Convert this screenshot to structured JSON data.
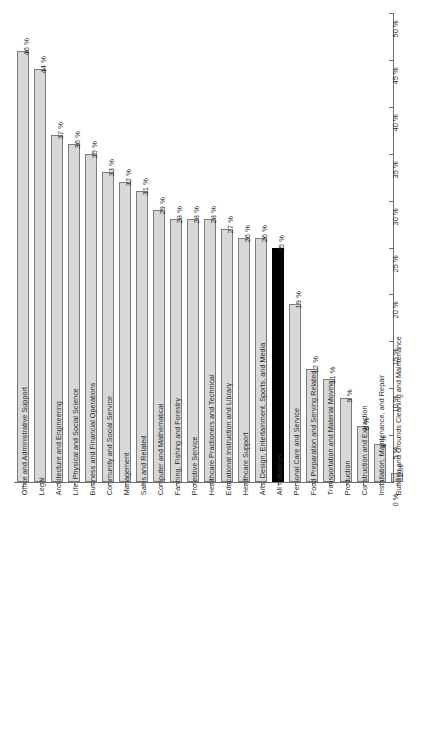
{
  "chart_data": {
    "type": "bar",
    "title": "",
    "subtitle": "",
    "xlabel": "",
    "ylabel": "",
    "ylim": [
      0,
      50
    ],
    "grid": false,
    "legend": "none",
    "orientation": "vertical",
    "axis_position": "right",
    "value_suffix": "%",
    "highlight_category": "All Industries",
    "colors": {
      "bar_fill": "#d8d8d8",
      "bar_border": "#7c7c7c",
      "highlight_fill": "#000000",
      "axis": "#6e6e6e",
      "text": "#2b2b2b",
      "background": "#ffffff"
    },
    "tick_labels": [
      "0 %",
      "5 %",
      "10 %",
      "15 %",
      "20 %",
      "25 %",
      "30 %",
      "35 %",
      "40 %",
      "45 %",
      "50 %"
    ],
    "tick_values": [
      0,
      5,
      10,
      15,
      20,
      25,
      30,
      35,
      40,
      45,
      50
    ],
    "categories": [
      "Office and Administrative Support",
      "Legal",
      "Architecture and Engineering",
      "Life, Physical and Social Science",
      "Business and Financial Operations",
      "Community and Social Service",
      "Management",
      "Sales and Related",
      "Computer and Mathematical",
      "Farming, Fishing and Forestry",
      "Protective Service",
      "Healthcare Practioners and Technical",
      "Educational Instruction and Library",
      "Healthcare Support",
      "All Industries",
      "Arts, Design, Entertainment, Sports, and Media",
      "Personal Care and Service",
      "Food Preparation and Serving Related",
      "Transportation and Material Moving",
      "Production",
      "Construction and Extraction",
      "Installation, Maintenance, and Repair",
      "Building and Grounds Cleaning and Maintenance"
    ],
    "values": [
      46,
      44,
      37,
      36,
      35,
      33,
      32,
      31,
      29,
      28,
      28,
      28,
      27,
      26,
      25,
      26,
      19,
      12,
      11,
      9,
      6,
      4,
      1
    ],
    "value_labels": [
      "46 %",
      "44 %",
      "37 %",
      "36 %",
      "35 %",
      "33 %",
      "32 %",
      "31 %",
      "29 %",
      "28 %",
      "28 %",
      "28 %",
      "27 %",
      "26 %",
      "25 %",
      "26 %",
      "19 %",
      "12 %",
      "11 %",
      "9 %",
      "6 %",
      "4 %",
      "1 %"
    ],
    "bars": [
      {
        "category": "Office and Administrative Support",
        "value": 46,
        "label": "46 %",
        "highlight": false
      },
      {
        "category": "Legal",
        "value": 44,
        "label": "44 %",
        "highlight": false
      },
      {
        "category": "Architecture and Engineering",
        "value": 37,
        "label": "37 %",
        "highlight": false
      },
      {
        "category": "Life, Physical and Social Science",
        "value": 36,
        "label": "36 %",
        "highlight": false
      },
      {
        "category": "Business and Financial Operations",
        "value": 35,
        "label": "35 %",
        "highlight": false
      },
      {
        "category": "Community and Social Service",
        "value": 33,
        "label": "33 %",
        "highlight": false
      },
      {
        "category": "Management",
        "value": 32,
        "label": "32 %",
        "highlight": false
      },
      {
        "category": "Sales and Related",
        "value": 31,
        "label": "31 %",
        "highlight": false
      },
      {
        "category": "Computer and Mathematical",
        "value": 29,
        "label": "29 %",
        "highlight": false
      },
      {
        "category": "Farming, Fishing and Forestry",
        "value": 28,
        "label": "28 %",
        "highlight": false
      },
      {
        "category": "Protective Service",
        "value": 28,
        "label": "28 %",
        "highlight": false
      },
      {
        "category": "Healthcare Practioners and Technical",
        "value": 28,
        "label": "28 %",
        "highlight": false
      },
      {
        "category": "Educational Instruction and Library",
        "value": 27,
        "label": "27 %",
        "highlight": false
      },
      {
        "category": "Healthcare Support",
        "value": 26,
        "label": "26 %",
        "highlight": false
      },
      {
        "category": "Arts, Design, Entertainment, Sports, and Media",
        "value": 26,
        "label": "26 %",
        "highlight": false
      },
      {
        "category": "All Industries",
        "value": 25,
        "label": "25 %",
        "highlight": true
      },
      {
        "category": "Personal Care and Service",
        "value": 19,
        "label": "19 %",
        "highlight": false
      },
      {
        "category": "Food Preparation and Serving Related",
        "value": 12,
        "label": "12 %",
        "highlight": false
      },
      {
        "category": "Transportation and Material Moving",
        "value": 11,
        "label": "11 %",
        "highlight": false
      },
      {
        "category": "Production",
        "value": 9,
        "label": "9 %",
        "highlight": false
      },
      {
        "category": "Construction and Extraction",
        "value": 6,
        "label": "6 %",
        "highlight": false
      },
      {
        "category": "Installation, Maintenance, and Repair",
        "value": 4,
        "label": "4 %",
        "highlight": false
      },
      {
        "category": "Building and Grounds Cleaning and Maintenance",
        "value": 1,
        "label": "1 %",
        "highlight": false
      }
    ]
  }
}
